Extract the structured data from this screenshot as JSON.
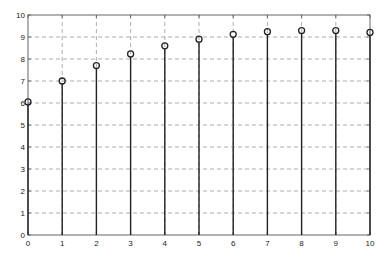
{
  "chart_data": {
    "type": "stem",
    "title": "",
    "xlabel": "",
    "ylabel": "",
    "x": [
      0,
      1,
      2,
      3,
      4,
      5,
      6,
      7,
      8,
      9,
      10
    ],
    "values": [
      6.05,
      7.0,
      7.7,
      8.23,
      8.6,
      8.9,
      9.12,
      9.24,
      9.29,
      9.29,
      9.21
    ],
    "xlim": [
      0,
      10
    ],
    "ylim": [
      0,
      10
    ],
    "xticks": [
      "0",
      "1",
      "2",
      "3",
      "4",
      "5",
      "6",
      "7",
      "8",
      "9",
      "10"
    ],
    "yticks": [
      "0",
      "1",
      "2",
      "3",
      "4",
      "5",
      "6",
      "7",
      "8",
      "9",
      "10"
    ],
    "grid": true,
    "grid_style": "dashed",
    "legend": null,
    "marker": "open-circle"
  },
  "colors": {
    "stem": "#222222",
    "marker": "#222222",
    "grid": "#9a9a9a",
    "axes": "#555555"
  },
  "layout": {
    "plot_left": 28,
    "plot_right": 370,
    "plot_top": 15,
    "plot_bottom": 235
  }
}
